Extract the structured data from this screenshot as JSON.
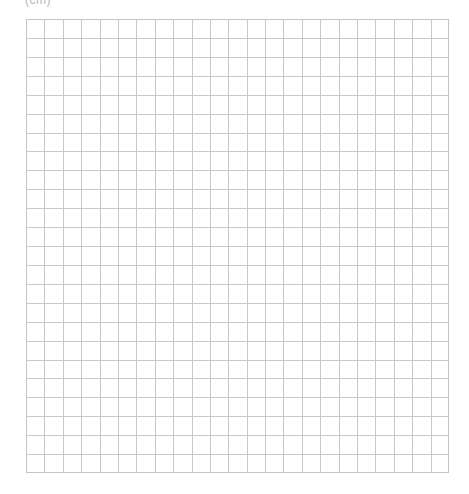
{
  "header": {
    "label": "(cm)"
  },
  "grid": {
    "columns": 23,
    "rows": 24,
    "line_color": "#c8c8c8",
    "background": "#ffffff"
  }
}
